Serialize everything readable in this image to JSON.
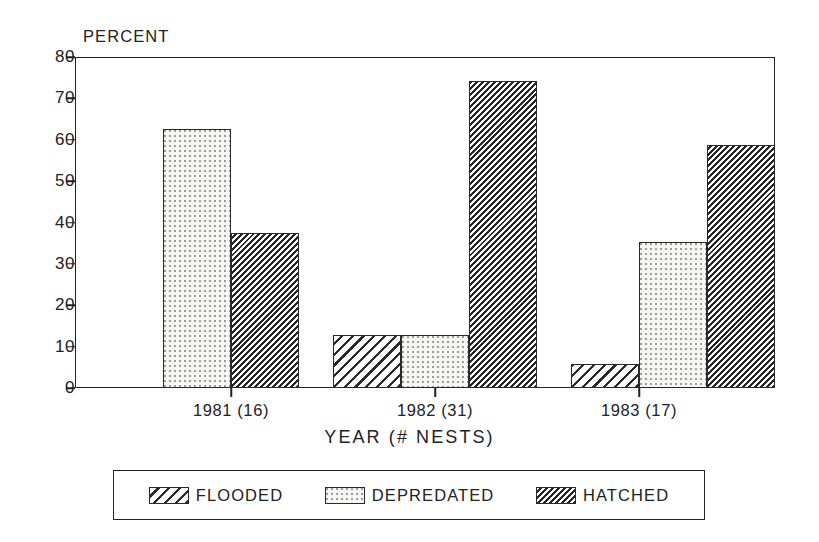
{
  "chart_data": {
    "type": "bar",
    "title": "",
    "xlabel": "YEAR (# NESTS)",
    "ylabel": "PERCENT",
    "ylim": [
      0,
      80
    ],
    "yticks": [
      0,
      10,
      20,
      30,
      40,
      50,
      60,
      70,
      80
    ],
    "ytick_labels": [
      "0",
      "10",
      "20",
      "30",
      "40",
      "50",
      "60",
      "70",
      "80"
    ],
    "grid": false,
    "legend_position": "below-axes",
    "categories": [
      "1981 (16)",
      "1982 (31)",
      "1983 (17)"
    ],
    "series": [
      {
        "name": "FLOODED",
        "pattern": "diagonal-hatch-wide",
        "values": [
          0,
          12.9,
          5.9
        ]
      },
      {
        "name": "DEPREDATED",
        "pattern": "fine-dots",
        "values": [
          62.5,
          12.9,
          35.3
        ]
      },
      {
        "name": "HATCHED",
        "pattern": "diagonal-hatch-dense",
        "values": [
          37.5,
          74.2,
          58.8
        ]
      }
    ]
  },
  "axes": {
    "y_title": "PERCENT",
    "x_title": "YEAR (# NESTS)",
    "y_labels": [
      "80",
      "70",
      "60",
      "50",
      "40",
      "30",
      "20",
      "10",
      "0"
    ],
    "x_labels": [
      "1981 (16)",
      "1982 (31)",
      "1983 (17)"
    ]
  },
  "legend": {
    "entries": [
      {
        "label": "FLOODED",
        "swatch": "diagonal-hatch-wide-swatch"
      },
      {
        "label": "DEPREDATED",
        "swatch": "fine-dots-swatch"
      },
      {
        "label": "HATCHED",
        "swatch": "diagonal-hatch-dense-swatch"
      }
    ]
  },
  "colors": {
    "ink": "#222222",
    "hatch": "#2b2b2b",
    "dot": "#9b9b9b",
    "background": "#ffffff"
  }
}
